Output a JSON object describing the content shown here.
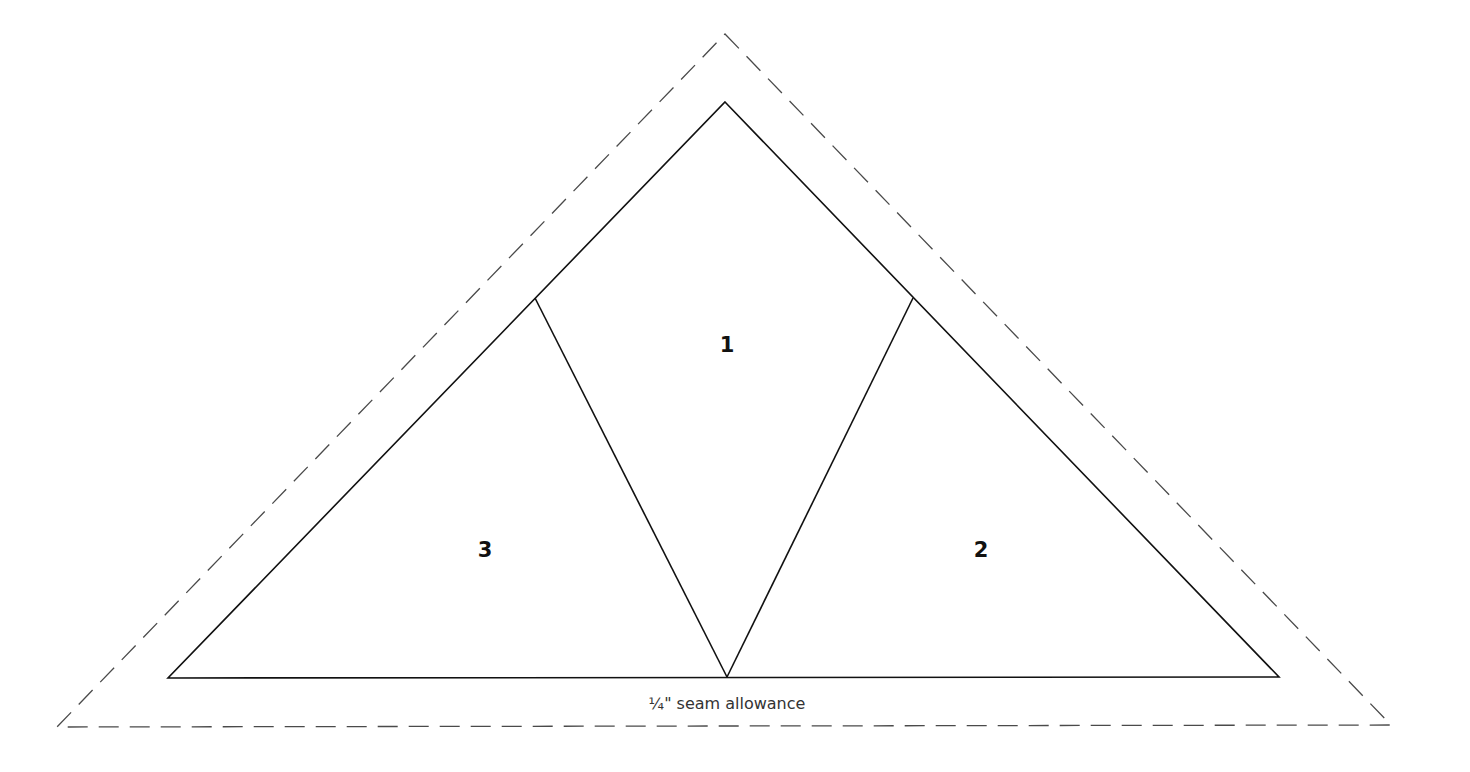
{
  "diagram": {
    "type": "foundation-paper-piecing-template",
    "shape": "triangle",
    "seam_allowance": {
      "label": "¼\" seam allowance",
      "style": "dashed",
      "color": "#4a4a4a",
      "outer_points": [
        [
          725,
          34
        ],
        [
          1391,
          725
        ],
        [
          57,
          727
        ]
      ]
    },
    "outline": {
      "style": "solid",
      "color": "#111111",
      "points": [
        [
          725,
          102
        ],
        [
          1279,
          677
        ],
        [
          168,
          678
        ]
      ]
    },
    "seams": [
      {
        "from": [
          535,
          298
        ],
        "to": [
          727,
          677
        ]
      },
      {
        "from": [
          913,
          298
        ],
        "to": [
          727,
          677
        ]
      }
    ],
    "pieces": [
      {
        "label": "1",
        "x": 727,
        "y": 345
      },
      {
        "label": "2",
        "x": 981,
        "y": 550
      },
      {
        "label": "3",
        "x": 485,
        "y": 550
      }
    ]
  }
}
